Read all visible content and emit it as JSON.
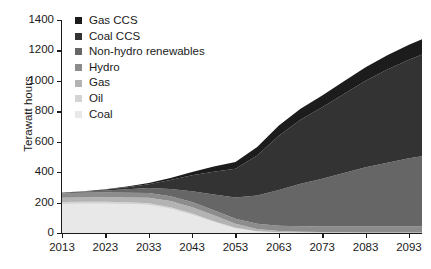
{
  "chart_data": {
    "type": "area",
    "stacked": true,
    "title": "",
    "xlabel": "",
    "ylabel": "Terawatt hours",
    "xlim": [
      2013,
      2096
    ],
    "ylim": [
      0,
      1400
    ],
    "grid": false,
    "legend_position": "top-left",
    "x_tick_labels": [
      "2013",
      "2023",
      "2033",
      "2043",
      "2053",
      "2063",
      "2073",
      "2083",
      "2093"
    ],
    "x_ticks": [
      2013,
      2023,
      2033,
      2043,
      2053,
      2063,
      2073,
      2083,
      2093
    ],
    "y_tick_labels": [
      "1400",
      "1200",
      "1000",
      "800",
      "600",
      "400",
      "200",
      "0"
    ],
    "y_ticks": [
      1400,
      1200,
      1000,
      800,
      600,
      400,
      200,
      0
    ],
    "x": [
      2013,
      2018,
      2023,
      2028,
      2033,
      2038,
      2043,
      2048,
      2053,
      2058,
      2063,
      2068,
      2073,
      2078,
      2083,
      2088,
      2093,
      2096
    ],
    "series": [
      {
        "name": "Coal",
        "color": "#e8e8e8",
        "values": [
          190,
          192,
          193,
          190,
          184,
          160,
          120,
          72,
          30,
          10,
          4,
          2,
          1,
          1,
          0,
          0,
          0,
          0
        ]
      },
      {
        "name": "Oil",
        "color": "#d4d4d4",
        "values": [
          14,
          13,
          12,
          12,
          11,
          10,
          8,
          6,
          4,
          2,
          1,
          1,
          0,
          0,
          0,
          0,
          0,
          0
        ]
      },
      {
        "name": "Gas",
        "color": "#b3b3b3",
        "values": [
          28,
          29,
          30,
          32,
          36,
          40,
          42,
          38,
          26,
          14,
          8,
          6,
          5,
          5,
          5,
          5,
          5,
          5
        ]
      },
      {
        "name": "Hydro",
        "color": "#8c8c8c",
        "values": [
          30,
          30,
          31,
          31,
          32,
          32,
          33,
          33,
          34,
          34,
          35,
          35,
          36,
          36,
          37,
          37,
          38,
          38
        ]
      },
      {
        "name": "Non-hydro renewables",
        "color": "#666666",
        "values": [
          4,
          8,
          14,
          22,
          32,
          48,
          72,
          104,
          140,
          186,
          234,
          280,
          314,
          352,
          390,
          420,
          448,
          462
        ]
      },
      {
        "name": "Coal CCS",
        "color": "#333333",
        "values": [
          0,
          2,
          6,
          14,
          26,
          58,
          104,
          150,
          188,
          264,
          358,
          420,
          470,
          520,
          568,
          612,
          648,
          668
        ]
      },
      {
        "name": "Gas CCS",
        "color": "#1c1c1c",
        "values": [
          0,
          1,
          2,
          4,
          8,
          14,
          22,
          34,
          44,
          56,
          66,
          72,
          78,
          84,
          90,
          94,
          98,
          100
        ]
      }
    ],
    "totals_note": "2013 total approx 266 TWh; 2096 total approx 1273 TWh"
  },
  "legend": {
    "items": [
      {
        "label": "Gas CCS",
        "color": "#1c1c1c"
      },
      {
        "label": "Coal CCS",
        "color": "#333333"
      },
      {
        "label": "Non-hydro renewables",
        "color": "#666666"
      },
      {
        "label": "Hydro",
        "color": "#8c8c8c"
      },
      {
        "label": "Gas",
        "color": "#b3b3b3"
      },
      {
        "label": "Oil",
        "color": "#d4d4d4"
      },
      {
        "label": "Coal",
        "color": "#e8e8e8"
      }
    ]
  },
  "axes": {
    "y_title": "Terawatt hours"
  }
}
